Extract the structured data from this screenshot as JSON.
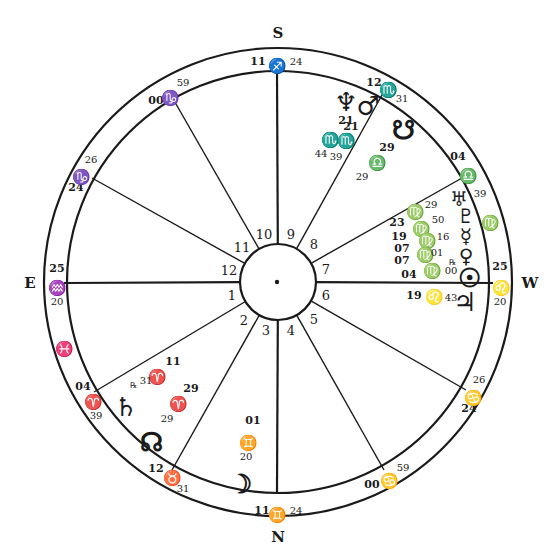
{
  "chart": {
    "center": [
      278,
      282
    ],
    "outer_radius": 234,
    "inner_ring_radius": 211,
    "hub_radius": 38,
    "line_color": "#1a1a1a",
    "background": "#ffffff"
  },
  "directions": {
    "south": "S",
    "north": "N",
    "east": "E",
    "west": "W"
  },
  "houses": [
    {
      "number": "1",
      "label_pos": [
        232,
        300
      ]
    },
    {
      "number": "2",
      "label_pos": [
        244,
        325
      ]
    },
    {
      "number": "3",
      "label_pos": [
        266,
        335
      ]
    },
    {
      "number": "4",
      "label_pos": [
        291,
        335
      ]
    },
    {
      "number": "5",
      "label_pos": [
        314,
        324
      ]
    },
    {
      "number": "6",
      "label_pos": [
        326,
        300
      ]
    },
    {
      "number": "7",
      "label_pos": [
        326,
        274
      ]
    },
    {
      "number": "8",
      "label_pos": [
        314,
        249
      ]
    },
    {
      "number": "9",
      "label_pos": [
        291,
        239
      ]
    },
    {
      "number": "10",
      "label_pos": [
        264,
        239
      ]
    },
    {
      "number": "11",
      "label_pos": [
        242,
        252
      ]
    },
    {
      "number": "12",
      "label_pos": [
        229,
        275
      ]
    }
  ],
  "cusps": [
    {
      "house": "10",
      "angle_deg": 90,
      "is_angle": true,
      "degree": "11",
      "sign": "♐",
      "minutes": "24",
      "deg_pos": [
        258,
        65
      ],
      "sign_pos": [
        277,
        66
      ],
      "min_pos": [
        296,
        65
      ]
    },
    {
      "house": "9",
      "angle_deg": 60,
      "is_angle": false,
      "degree": "12",
      "sign": "♏",
      "minutes": "31",
      "deg_pos": [
        374,
        86
      ],
      "sign_pos": [
        388,
        90
      ],
      "min_pos": [
        402,
        102
      ]
    },
    {
      "house": "8",
      "angle_deg": 30,
      "is_angle": false,
      "degree": "04",
      "sign": "♎",
      "minutes": "39",
      "deg_pos": [
        458,
        160
      ],
      "sign_pos": [
        468,
        176
      ],
      "min_pos": [
        480,
        197
      ]
    },
    {
      "house": "7",
      "angle_deg": 0,
      "is_angle": true,
      "degree": "25",
      "sign": "♌",
      "minutes": "20",
      "deg_pos": [
        500,
        270
      ],
      "sign_pos": [
        501,
        288
      ],
      "min_pos": [
        500,
        305
      ]
    },
    {
      "house": "6",
      "angle_deg": -30,
      "is_angle": false,
      "degree": "24",
      "sign": "♋",
      "minutes": "26",
      "deg_pos": [
        469,
        412
      ],
      "sign_pos": [
        473,
        398
      ],
      "min_pos": [
        479,
        383
      ]
    },
    {
      "house": "5",
      "angle_deg": -60,
      "is_angle": false,
      "degree": "00",
      "sign": "♋",
      "minutes": "59",
      "deg_pos": [
        372,
        488
      ],
      "sign_pos": [
        389,
        481
      ],
      "min_pos": [
        403,
        471
      ]
    },
    {
      "house": "4",
      "angle_deg": -90,
      "is_angle": true,
      "degree": "11",
      "sign": "♊",
      "minutes": "24",
      "deg_pos": [
        262,
        514
      ],
      "sign_pos": [
        277,
        515
      ],
      "min_pos": [
        296,
        514
      ]
    },
    {
      "house": "3",
      "angle_deg": -120,
      "is_angle": false,
      "degree": "12",
      "sign": "♉",
      "minutes": "31",
      "deg_pos": [
        156,
        472
      ],
      "sign_pos": [
        172,
        478
      ],
      "min_pos": [
        183,
        492
      ]
    },
    {
      "house": "2",
      "angle_deg": -150,
      "is_angle": false,
      "degree": "04",
      "sign": "♈",
      "minutes": "39",
      "deg_pos": [
        83,
        390
      ],
      "sign_pos": [
        93,
        402
      ],
      "min_pos": [
        96,
        419
      ]
    },
    {
      "house": "1",
      "angle_deg": 180,
      "is_angle": true,
      "degree": "25",
      "sign": "♒",
      "minutes": "20",
      "deg_pos": [
        57,
        272
      ],
      "sign_pos": [
        57,
        288
      ],
      "min_pos": [
        57,
        305
      ]
    },
    {
      "house": "12",
      "angle_deg": 150,
      "is_angle": false,
      "degree": "24",
      "sign": "♑",
      "minutes": "26",
      "deg_pos": [
        76,
        191
      ],
      "sign_pos": [
        81,
        177
      ],
      "min_pos": [
        91,
        163
      ]
    },
    {
      "house": "11",
      "angle_deg": 120,
      "is_angle": false,
      "degree": "00",
      "sign": "♑",
      "minutes": "59",
      "deg_pos": [
        156,
        104
      ],
      "sign_pos": [
        170,
        98
      ],
      "min_pos": [
        183,
        86
      ]
    }
  ],
  "cusp_endpoints": [
    [
      277,
      71
    ],
    [
      382,
      95
    ],
    [
      462,
      178
    ],
    [
      493,
      283
    ],
    [
      466,
      390
    ],
    [
      384,
      470
    ],
    [
      277,
      492
    ],
    [
      172,
      470
    ],
    [
      94,
      392
    ],
    [
      64,
      283
    ],
    [
      92,
      178
    ],
    [
      172,
      97
    ]
  ],
  "intercepted": [
    {
      "sign": "♓",
      "name": "pisces",
      "pos": [
        64,
        350
      ]
    },
    {
      "sign": "♍",
      "name": "virgo",
      "pos": [
        490,
        224
      ]
    }
  ],
  "planets": [
    {
      "name": "neptune",
      "glyph": "♆",
      "pos": [
        346,
        103
      ],
      "size": "lg",
      "degree": "21",
      "sign": "♏",
      "minutes": "44",
      "deg_pos": [
        346,
        124
      ],
      "sign_pos": [
        330,
        141
      ],
      "min_pos": [
        321,
        157
      ]
    },
    {
      "name": "mars",
      "glyph": "♂",
      "pos": [
        368,
        107
      ],
      "size": "lg",
      "degree": "21",
      "sign": "♏",
      "minutes": "39",
      "deg_pos": [
        351,
        130
      ],
      "sign_pos": [
        346,
        142
      ],
      "min_pos": [
        336,
        160
      ]
    },
    {
      "name": "south-node",
      "glyph": "☋",
      "pos": [
        403,
        131
      ],
      "size": "lg",
      "degree": "29",
      "sign": "♎",
      "minutes": "29",
      "deg_pos": [
        387,
        151
      ],
      "sign_pos": [
        377,
        164
      ],
      "min_pos": [
        362,
        180
      ]
    },
    {
      "name": "uranus",
      "glyph": "♅",
      "pos": [
        459,
        198
      ],
      "size": "md",
      "degree": "23",
      "sign": "♍",
      "minutes": "29",
      "deg_pos": [
        397,
        226
      ],
      "sign_pos": [
        415,
        213
      ],
      "min_pos": [
        431,
        208
      ]
    },
    {
      "name": "pluto",
      "glyph": "♇",
      "pos": [
        466,
        215
      ],
      "size": "md",
      "degree": "19",
      "sign": "♍",
      "minutes": "50",
      "deg_pos": [
        399,
        240
      ],
      "sign_pos": [
        421,
        230
      ],
      "min_pos": [
        438,
        223
      ]
    },
    {
      "name": "mercury",
      "glyph": "☿",
      "pos": [
        466,
        235
      ],
      "size": "md",
      "degree": "07",
      "sign": "♍",
      "minutes": "16",
      "deg_pos": [
        402,
        252
      ],
      "sign_pos": [
        427,
        242
      ],
      "min_pos": [
        443,
        240
      ]
    },
    {
      "name": "venus",
      "glyph": "♀",
      "pos": [
        466,
        255
      ],
      "size": "md",
      "degree": "07",
      "sign": "♍",
      "minutes": "01",
      "deg_pos": [
        402,
        264
      ],
      "sign_pos": [
        425,
        256
      ],
      "min_pos": [
        437,
        256
      ]
    },
    {
      "name": "sun",
      "glyph": "☉",
      "pos": [
        469,
        279
      ],
      "size": "lg",
      "degree": "04",
      "sign": "♍",
      "minutes": "00",
      "deg_pos": [
        409,
        278
      ],
      "sign_pos": [
        432,
        272
      ],
      "min_pos": [
        451,
        274
      ]
    },
    {
      "name": "jupiter",
      "glyph": "♃",
      "pos": [
        465,
        303
      ],
      "size": "lg",
      "degree": "19",
      "sign": "♌",
      "minutes": "43",
      "deg_pos": [
        414,
        299
      ],
      "sign_pos": [
        434,
        298
      ],
      "min_pos": [
        451,
        301
      ]
    },
    {
      "name": "saturn",
      "glyph": "♄",
      "pos": [
        126,
        408
      ],
      "size": "lg",
      "degree": "11",
      "sign": "♈",
      "minutes": "31",
      "deg_pos": [
        173,
        365
      ],
      "sign_pos": [
        157,
        378
      ],
      "min_pos": [
        146,
        384
      ]
    },
    {
      "name": "north-node",
      "glyph": "☊",
      "pos": [
        151,
        443
      ],
      "size": "lg",
      "degree": "29",
      "sign": "♈",
      "minutes": "29",
      "deg_pos": [
        191,
        392
      ],
      "sign_pos": [
        178,
        405
      ],
      "min_pos": [
        167,
        422
      ]
    },
    {
      "name": "moon",
      "glyph": "☽",
      "pos": [
        240,
        485
      ],
      "size": "lg",
      "degree": "01",
      "sign": "♊",
      "minutes": "20",
      "deg_pos": [
        253,
        424
      ],
      "sign_pos": [
        248,
        444
      ],
      "min_pos": [
        246,
        460
      ]
    }
  ],
  "retrograde": [
    {
      "planet": "venus",
      "symbol": "℞",
      "pos": [
        452,
        265
      ]
    },
    {
      "planet": "saturn",
      "symbol": "℞",
      "pos": [
        133,
        388
      ]
    }
  ]
}
